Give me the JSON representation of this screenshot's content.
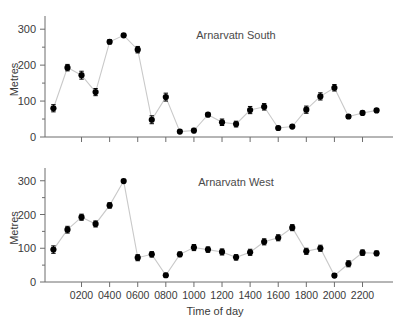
{
  "figure": {
    "width": 406,
    "height": 327,
    "background": "#ffffff",
    "marker_color": "#000000",
    "line_color": "#c9c9c9",
    "axis_color": "#6d6d6d"
  },
  "chart_data": [
    {
      "type": "line",
      "title": "Arnarvatn South",
      "xlabel": "",
      "ylabel": "Metres",
      "xlim": [
        -0.6,
        23.6
      ],
      "ylim": [
        0,
        320
      ],
      "grid": false,
      "legend": "none",
      "markers": "filled-circle-with-errorbars",
      "yticks": [
        0,
        100,
        200,
        300
      ],
      "ytick_labels": [
        "0",
        "100",
        "200",
        "300"
      ],
      "yminor_ticks": [
        50,
        150,
        250
      ],
      "xticks": [
        2,
        4,
        6,
        8,
        10,
        12,
        14,
        16,
        18,
        20,
        22
      ],
      "xtick_labels": [
        "",
        "",
        "",
        "",
        "",
        "",
        "",
        "",
        "",
        "",
        ""
      ],
      "x": [
        "0000",
        "0100",
        "0200",
        "0300",
        "0400",
        "0500",
        "0600",
        "0700",
        "0800",
        "0900",
        "1000",
        "1100",
        "1200",
        "1300",
        "1400",
        "1500",
        "1600",
        "1700",
        "1800",
        "1900",
        "2000",
        "2100",
        "2200",
        "2300"
      ],
      "values": [
        80,
        193,
        172,
        125,
        265,
        283,
        243,
        48,
        111,
        15,
        18,
        62,
        41,
        36,
        75,
        84,
        25,
        29,
        76,
        113,
        137,
        57,
        67,
        74
      ],
      "errors": [
        10,
        9,
        11,
        10,
        6,
        5,
        9,
        11,
        11,
        5,
        6,
        5,
        9,
        8,
        10,
        9,
        5,
        4,
        10,
        10,
        9,
        5,
        5,
        4
      ]
    },
    {
      "type": "line",
      "title": "Arnarvatn West",
      "xlabel": "Time of day",
      "ylabel": "Metres",
      "xlim": [
        -0.6,
        23.6
      ],
      "ylim": [
        0,
        320
      ],
      "grid": false,
      "legend": "none",
      "markers": "filled-circle-with-errorbars",
      "yticks": [
        0,
        100,
        200,
        300
      ],
      "ytick_labels": [
        "0",
        "100",
        "200",
        "300"
      ],
      "yminor_ticks": [
        50,
        150,
        250
      ],
      "xticks": [
        2,
        4,
        6,
        8,
        10,
        12,
        14,
        16,
        18,
        20,
        22
      ],
      "xtick_labels": [
        "0200",
        "0400",
        "0600",
        "0800",
        "1000",
        "1200",
        "1400",
        "1600",
        "1800",
        "2000",
        "2200"
      ],
      "x": [
        "0000",
        "0100",
        "0200",
        "0300",
        "0400",
        "0500",
        "0600",
        "0700",
        "0800",
        "0900",
        "1000",
        "1100",
        "1200",
        "1300",
        "1400",
        "1500",
        "1600",
        "1700",
        "1800",
        "1900",
        "2000",
        "2100",
        "2200",
        "2300"
      ],
      "values": [
        96,
        155,
        192,
        172,
        227,
        299,
        72,
        82,
        20,
        82,
        102,
        96,
        89,
        73,
        88,
        119,
        131,
        161,
        91,
        100,
        19,
        54,
        87,
        85
      ],
      "errors": [
        11,
        10,
        9,
        9,
        8,
        5,
        9,
        8,
        6,
        7,
        9,
        8,
        9,
        8,
        9,
        9,
        9,
        9,
        9,
        9,
        5,
        9,
        8,
        7
      ]
    }
  ]
}
